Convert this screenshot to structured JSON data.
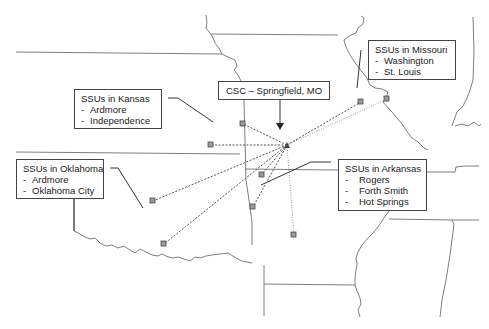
{
  "diagram": {
    "hub": {
      "label": "CSC – Springfield, MO",
      "icon": "triangle-hub-icon"
    },
    "groups": [
      {
        "id": "kansas",
        "title": "SSUs in Kansas",
        "items": [
          "Ardmore",
          "Independence"
        ]
      },
      {
        "id": "oklahoma",
        "title": "SSUs in Oklahoma",
        "items": [
          "Ardmore",
          "Oklahoma City"
        ]
      },
      {
        "id": "missouri",
        "title": "SSUs in Missouri",
        "items": [
          "Washington",
          "St. Louis"
        ]
      },
      {
        "id": "arkansas",
        "title": "SSUs in Arkansas",
        "items": [
          "Rogers",
          "Forth Smith",
          "Hot Springs"
        ]
      }
    ],
    "item_bullet": "-",
    "colors": {
      "background": "#ffffff",
      "border_lines": "#6f6f6f",
      "ssu_marker_fill": "#9a9a9a",
      "hub_marker": "#444444",
      "text": "#222222"
    }
  }
}
